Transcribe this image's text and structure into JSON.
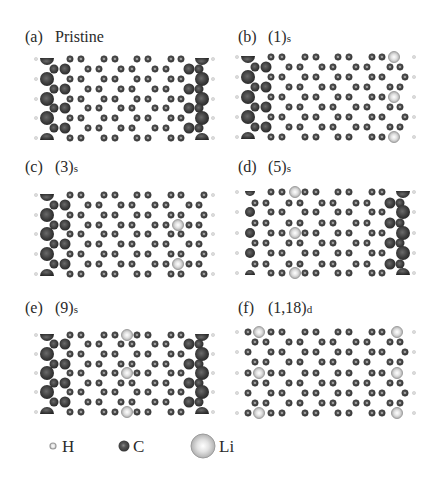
{
  "figure": {
    "panels": [
      {
        "id": "a",
        "letter": "(a)",
        "title": "Pristine",
        "subscript": "",
        "label_pos": [
          25,
          42
        ],
        "title_x": 55,
        "rows_y": [
          59,
          69,
          79,
          89,
          99,
          108,
          118,
          128,
          138
        ],
        "left_edge": "passivated",
        "right_edge": "passivated",
        "origin_x": 0,
        "li": []
      },
      {
        "id": "b",
        "letter": "(b)",
        "title": "(1)",
        "subscript": "s",
        "label_pos": [
          238,
          42
        ],
        "title_x": 268,
        "rows_y": [
          57,
          67,
          77,
          87,
          97,
          107,
          117,
          127,
          137
        ],
        "left_edge": "passivated",
        "right_edge": "plain",
        "origin_x": 201,
        "li": [
          {
            "row": 0,
            "x": 394
          },
          {
            "row": 4,
            "x": 394
          },
          {
            "row": 8,
            "x": 394
          }
        ]
      },
      {
        "id": "c",
        "letter": "(c)",
        "title": "(3)",
        "subscript": "s",
        "label_pos": [
          25,
          172
        ],
        "title_x": 55,
        "rows_y": [
          195,
          205,
          215,
          225,
          234,
          244,
          254,
          264,
          274
        ],
        "left_edge": "passivated",
        "right_edge": "plain",
        "origin_x": 0,
        "li": [
          {
            "row": 3,
            "x": 178
          },
          {
            "row": 7,
            "x": 178
          }
        ]
      },
      {
        "id": "d",
        "letter": "(d)",
        "title": "(5)",
        "subscript": "s",
        "label_pos": [
          238,
          172
        ],
        "title_x": 268,
        "rows_y": [
          192,
          203,
          212,
          223,
          233,
          243,
          253,
          264,
          273
        ],
        "left_edge": "medium",
        "right_edge": "passivated",
        "origin_x": 201,
        "li": [
          {
            "row": 0,
            "x": 295
          },
          {
            "row": 4,
            "x": 295
          },
          {
            "row": 8,
            "x": 295
          }
        ]
      },
      {
        "id": "e",
        "letter": "(e)",
        "title": "(9)",
        "subscript": "s",
        "label_pos": [
          25,
          313
        ],
        "title_x": 55,
        "rows_y": [
          335,
          344,
          354,
          364,
          373,
          383,
          392,
          402,
          412
        ],
        "left_edge": "passivated",
        "right_edge": "passivated",
        "origin_x": 0,
        "li": [
          {
            "row": 0,
            "x": 127
          },
          {
            "row": 4,
            "x": 127
          },
          {
            "row": 8,
            "x": 127
          }
        ]
      },
      {
        "id": "f",
        "letter": "(f)",
        "title": "(1,18)",
        "subscript": "d",
        "label_pos": [
          238,
          313
        ],
        "title_x": 268,
        "rows_y": [
          332,
          342,
          352,
          362,
          373,
          383,
          393,
          403,
          413
        ],
        "left_edge": "plain",
        "right_edge": "plain",
        "origin_x": 201,
        "li": [
          {
            "row": 0,
            "x": 259
          },
          {
            "row": 4,
            "x": 259
          },
          {
            "row": 8,
            "x": 259
          },
          {
            "row": 0,
            "x": 397
          },
          {
            "row": 4,
            "x": 397
          },
          {
            "row": 8,
            "x": 397
          }
        ]
      }
    ],
    "legend": {
      "items": [
        {
          "element": "H",
          "label": "H",
          "symbol_x": 53,
          "text_x": 62,
          "radius": 3
        },
        {
          "element": "C",
          "label": "C",
          "symbol_x": 124,
          "text_x": 133,
          "radius": 5.5
        },
        {
          "element": "Li",
          "label": "Li",
          "symbol_x": 203,
          "text_x": 219,
          "radius": 12
        }
      ],
      "y": 446
    },
    "colors": {
      "carbon": "#4a4a4a",
      "carbon_dark": "#2e2e2e",
      "carbon_ring": "#6e6e6e",
      "hydrogen": "#c8c8c8",
      "lithium": "#d4d4d4",
      "lithium_rim": "#a8a8a8",
      "edge_big": "#3c3c3c",
      "text": "#2a2a2a"
    }
  }
}
